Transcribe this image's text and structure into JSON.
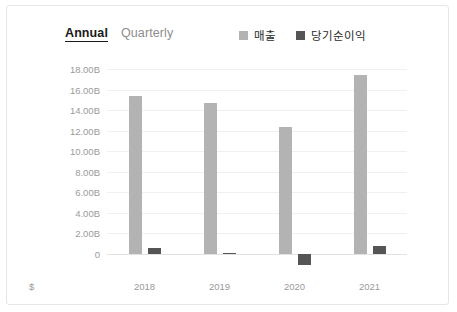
{
  "card": {
    "border_color": "#e6e6e6",
    "background": "#ffffff"
  },
  "tabs": [
    {
      "label": "Annual",
      "active": true
    },
    {
      "label": "Quarterly",
      "active": false
    }
  ],
  "legend": [
    {
      "label": "매출",
      "color": "#b3b3b3"
    },
    {
      "label": "당기순이익",
      "color": "#555555"
    }
  ],
  "currency_marker": "$",
  "chart_data": {
    "type": "bar",
    "title": "",
    "xlabel": "",
    "ylabel": "",
    "categories": [
      "2018",
      "2019",
      "2020",
      "2021"
    ],
    "series": [
      {
        "name": "매출",
        "color": "#b3b3b3",
        "values": [
          15.4,
          14.7,
          12.3,
          17.4
        ]
      },
      {
        "name": "당기순이익",
        "color": "#555555",
        "values": [
          0.55,
          0.08,
          -1.1,
          0.75
        ]
      }
    ],
    "ylim": [
      -2,
      18
    ],
    "yticks": [
      0,
      2,
      4,
      6,
      8,
      10,
      12,
      14,
      16,
      18
    ],
    "ytick_labels": [
      "0",
      "2.00B",
      "4.00B",
      "6.00B",
      "8.00B",
      "10.00B",
      "12.00B",
      "14.00B",
      "16.00B",
      "18.00B"
    ],
    "grid": true,
    "legend_position": "top-right",
    "value_suffix": "B"
  }
}
